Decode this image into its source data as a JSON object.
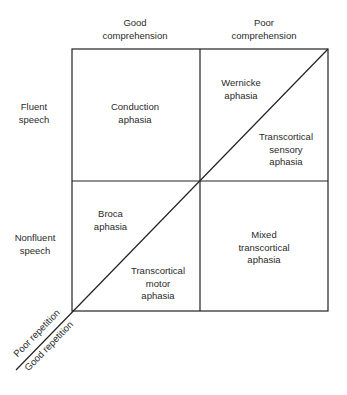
{
  "columns": {
    "good": [
      "Good",
      "comprehension"
    ],
    "poor": [
      "Poor",
      "comprehension"
    ]
  },
  "rows": {
    "fluent": [
      "Fluent",
      "speech"
    ],
    "nonfluent": [
      "Nonfluent",
      "speech"
    ]
  },
  "cells": {
    "conduction": [
      "Conduction",
      "aphasia"
    ],
    "wernicke": [
      "Wernicke",
      "aphasia"
    ],
    "transcortical_sensory": [
      "Transcortical",
      "sensory",
      "aphasia"
    ],
    "broca": [
      "Broca",
      "aphasia"
    ],
    "transcortical_motor": [
      "Transcortical",
      "motor",
      "aphasia"
    ],
    "mixed_transcortical": [
      "Mixed",
      "transcortical",
      "aphasia"
    ]
  },
  "axis": {
    "poor_repetition": "Poor repetition",
    "good_repetition": "Good repetition"
  }
}
